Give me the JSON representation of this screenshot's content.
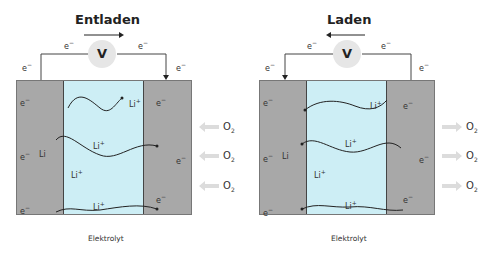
{
  "diagrams": [
    {
      "title": "Entladen",
      "direction": "right",
      "voltmeter": "V",
      "electron": "e",
      "ion": "Li",
      "electrolyte_label": "Elektrolyt",
      "anode_label": "Li",
      "gas": "O",
      "gas_sub": "2",
      "gas_flow": "inward"
    },
    {
      "title": "Laden",
      "direction": "left",
      "voltmeter": "V",
      "electron": "e",
      "ion": "Li",
      "electrolyte_label": "Elektrolyt",
      "anode_label": "Li",
      "gas": "O",
      "gas_sub": "2",
      "gas_flow": "outward"
    }
  ],
  "colors": {
    "electrode": "#a8a8a8",
    "electrolyte": "#cdeef5",
    "gas_arrow": "#dcdcdc",
    "voltmeter": "#e6e6e6"
  }
}
